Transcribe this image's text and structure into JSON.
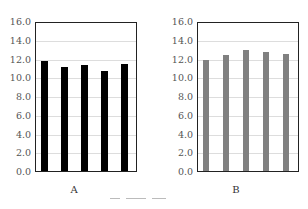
{
  "chart_data": [
    {
      "type": "bar",
      "title": "",
      "xlabel": "A",
      "ylabel": "",
      "ylim": [
        0,
        16
      ],
      "yticks": [
        "0.0",
        "2.0",
        "4.0",
        "6.0",
        "8.0",
        "10.0",
        "12.0",
        "14.0",
        "16.0"
      ],
      "grid": true,
      "categories": [
        "1",
        "2",
        "3",
        "4",
        "5"
      ],
      "values": [
        11.7,
        11.1,
        11.3,
        10.7,
        11.4
      ],
      "bar_color": "#000000"
    },
    {
      "type": "bar",
      "title": "",
      "xlabel": "B",
      "ylabel": "",
      "ylim": [
        0,
        16
      ],
      "yticks": [
        "0.0",
        "2.0",
        "4.0",
        "6.0",
        "8.0",
        "10.0",
        "12.0",
        "14.0",
        "16.0"
      ],
      "grid": true,
      "categories": [
        "1",
        "2",
        "3",
        "4",
        "5"
      ],
      "values": [
        11.8,
        12.4,
        12.9,
        12.7,
        12.5
      ],
      "bar_color": "#808080"
    }
  ]
}
